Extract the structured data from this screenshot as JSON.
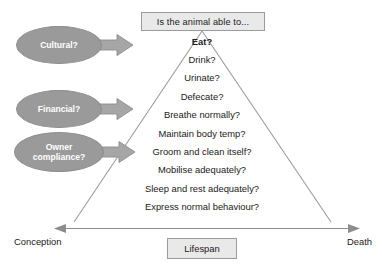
{
  "diagram": {
    "title": "Is the animal able to...",
    "header_label": "Is the animal able to...",
    "axis": {
      "start_label": "Conception",
      "end_label": "Death",
      "center_box_label": "Lifespan"
    },
    "factors": [
      {
        "label": "Cultural?",
        "arrow_icon": "right-arrow-icon"
      },
      {
        "label": "Financial?",
        "arrow_icon": "right-arrow-icon"
      },
      {
        "label": "Owner compliance?",
        "arrow_icon": "right-arrow-icon"
      }
    ],
    "pyramid_items": [
      {
        "label": "Eat?",
        "emphasis": true
      },
      {
        "label": "Drink?",
        "emphasis": false
      },
      {
        "label": "Urinate?",
        "emphasis": false
      },
      {
        "label": "Defecate?",
        "emphasis": false
      },
      {
        "label": "Breathe normally?",
        "emphasis": false
      },
      {
        "label": "Maintain body temp?",
        "emphasis": false
      },
      {
        "label": "Groom and clean itself?",
        "emphasis": false
      },
      {
        "label": "Mobilise adequately?",
        "emphasis": false
      },
      {
        "label": "Sleep and rest adequately?",
        "emphasis": false
      },
      {
        "label": "Express normal behaviour?",
        "emphasis": false
      }
    ],
    "colors": {
      "ellipse_fill": "#9a9a9a",
      "ellipse_text": "#ffffff",
      "arrow_fill": "#a6a6a6",
      "arrow_stroke": "#8d8d8d",
      "box_fill": "#e9e9e9",
      "box_stroke": "#9b9b9b",
      "triangle_stroke": "#9b9b9b",
      "axis_stroke": "#8d8d8d",
      "text": "#1a1a1a",
      "background": "#ffffff"
    }
  }
}
